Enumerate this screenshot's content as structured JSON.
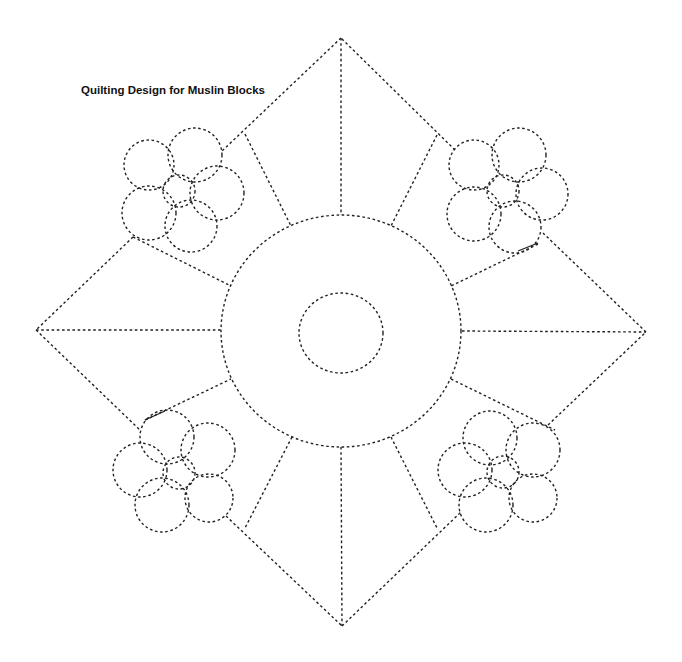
{
  "title": "Quilting Design for Muslin Blocks",
  "colors": {
    "stroke": "#222222",
    "background": "#ffffff",
    "text": "#111111"
  },
  "diagram": {
    "diamond": {
      "top": [
        341,
        38
      ],
      "right": [
        646,
        332
      ],
      "bottom": [
        342,
        626
      ],
      "left": [
        36,
        330
      ]
    },
    "outline_segments": [
      [
        [
          341,
          38
        ],
        [
          222,
          151
        ]
      ],
      [
        [
          133,
          237
        ],
        [
          36,
          330
        ]
      ],
      [
        [
          36,
          330
        ],
        [
          141,
          431
        ]
      ],
      [
        [
          226,
          516
        ],
        [
          342,
          626
        ]
      ],
      [
        [
          342,
          626
        ],
        [
          461,
          512
        ]
      ],
      [
        [
          548,
          425
        ],
        [
          646,
          332
        ]
      ],
      [
        [
          646,
          332
        ],
        [
          543,
          233
        ]
      ],
      [
        [
          455,
          150
        ],
        [
          341,
          38
        ]
      ]
    ],
    "center_circle": {
      "cx": 341,
      "cy": 331,
      "rx": 120,
      "ry": 116
    },
    "inner_circle": {
      "cx": 341,
      "cy": 333,
      "rx": 42,
      "ry": 40
    },
    "spokes": [
      [
        [
          341,
          38
        ],
        [
          341,
          215
        ]
      ],
      [
        [
          36,
          330
        ],
        [
          221,
          330
        ]
      ],
      [
        [
          462,
          331
        ],
        [
          646,
          332
        ]
      ],
      [
        [
          341,
          447
        ],
        [
          342,
          626
        ]
      ],
      [
        [
          245,
          134
        ],
        [
          291,
          226
        ]
      ],
      [
        [
          437,
          135
        ],
        [
          391,
          226
        ]
      ],
      [
        [
          133,
          237
        ],
        [
          231,
          286
        ]
      ],
      [
        [
          538,
          244
        ],
        [
          451,
          286
        ]
      ],
      [
        [
          145,
          420
        ],
        [
          231,
          379
        ]
      ],
      [
        [
          451,
          379
        ],
        [
          555,
          430
        ]
      ],
      [
        [
          292,
          437
        ],
        [
          245,
          528
        ]
      ],
      [
        [
          391,
          437
        ],
        [
          438,
          530
        ]
      ]
    ],
    "solid_marks": [
      [
        [
          145,
          420
        ],
        [
          165,
          411
        ]
      ],
      [
        [
          518,
          251
        ],
        [
          538,
          243
        ]
      ]
    ],
    "flowers": [
      {
        "name": "top-left",
        "center": {
          "cx": 179,
          "cy": 191,
          "r": 16
        },
        "petals": [
          {
            "cx": 149,
            "cy": 165,
            "r": 25
          },
          {
            "cx": 195,
            "cy": 155,
            "r": 27
          },
          {
            "cx": 217,
            "cy": 193,
            "r": 27
          },
          {
            "cx": 149,
            "cy": 213,
            "r": 27
          },
          {
            "cx": 191,
            "cy": 226,
            "r": 26
          }
        ]
      },
      {
        "name": "top-right",
        "center": {
          "cx": 503,
          "cy": 191,
          "r": 16
        },
        "petals": [
          {
            "cx": 474,
            "cy": 165,
            "r": 25
          },
          {
            "cx": 519,
            "cy": 155,
            "r": 27
          },
          {
            "cx": 542,
            "cy": 194,
            "r": 26
          },
          {
            "cx": 474,
            "cy": 214,
            "r": 27
          },
          {
            "cx": 515,
            "cy": 227,
            "r": 26
          }
        ]
      },
      {
        "name": "bottom-left",
        "center": {
          "cx": 179,
          "cy": 473,
          "r": 16
        },
        "petals": [
          {
            "cx": 167,
            "cy": 437,
            "r": 27
          },
          {
            "cx": 208,
            "cy": 450,
            "r": 27
          },
          {
            "cx": 140,
            "cy": 470,
            "r": 27
          },
          {
            "cx": 162,
            "cy": 505,
            "r": 27
          },
          {
            "cx": 209,
            "cy": 498,
            "r": 24
          }
        ]
      },
      {
        "name": "bottom-right",
        "center": {
          "cx": 503,
          "cy": 472,
          "r": 16
        },
        "petals": [
          {
            "cx": 490,
            "cy": 438,
            "r": 27
          },
          {
            "cx": 533,
            "cy": 450,
            "r": 27
          },
          {
            "cx": 465,
            "cy": 470,
            "r": 27
          },
          {
            "cx": 486,
            "cy": 505,
            "r": 27
          },
          {
            "cx": 533,
            "cy": 498,
            "r": 24
          }
        ]
      }
    ]
  }
}
